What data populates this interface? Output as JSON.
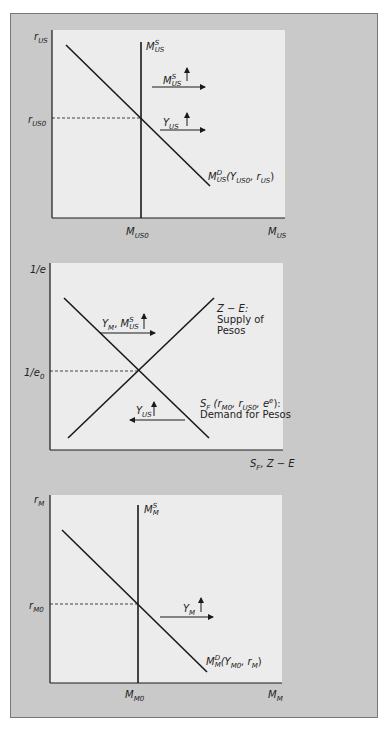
{
  "figure": {
    "panels": [
      {
        "id": "us-money-market",
        "y_axis_label": "r",
        "y_axis_sub": "US",
        "y_tick_label": "r",
        "y_tick_sub": "US0",
        "x_tick_label": "M",
        "x_tick_sub": "US0",
        "x_axis_label": "M",
        "x_axis_sub": "US",
        "supply_curve": {
          "main": "M",
          "sup": "S",
          "sub": "US"
        },
        "demand_curve": {
          "main": "M",
          "sup": "D",
          "sub": "US",
          "args": "(Y",
          "arg1_sub": "US0",
          "sep": ", r",
          "arg2_sub": "US",
          "close": ")"
        },
        "shifts": [
          {
            "main": "M",
            "sup": "S",
            "sub": "US",
            "arrow": "↑",
            "direction": "right"
          },
          {
            "main": "Y",
            "sub": "US",
            "arrow": "↑",
            "direction": "right"
          }
        ]
      },
      {
        "id": "foreign-exchange-market",
        "y_axis_label": "1/e",
        "y_tick_label": "1/e",
        "y_tick_sub": "0",
        "x_axis_label_a": "S",
        "x_axis_sub_a": "F",
        "x_axis_label_b": ", Z − E",
        "supply_curve": {
          "line1": "Z − E:",
          "line2": "Supply of",
          "line3": "Pesos"
        },
        "demand_curve": {
          "main": "S",
          "sub": "F",
          "open": " (r",
          "a1": "M0",
          "s1": ", r",
          "a2": "US0",
          "s2": ", e",
          "sup": "e",
          "close": "):",
          "line2": "Demand for Pesos"
        },
        "shifts": [
          {
            "main_a": "Y",
            "sub_a": "M",
            "sep": ", ",
            "main_b": "M",
            "sup_b": "S",
            "sub_b": "US",
            "arrow": "↑",
            "direction": "right"
          },
          {
            "main": "Y",
            "sub": "US",
            "arrow": "↑",
            "direction": "left"
          }
        ]
      },
      {
        "id": "mexico-money-market",
        "y_axis_label": "r",
        "y_axis_sub": "M",
        "y_tick_label": "r",
        "y_tick_sub": "M0",
        "x_tick_label": "M",
        "x_tick_sub": "M0",
        "x_axis_label": "M",
        "x_axis_sub": "M",
        "supply_curve": {
          "main": "M",
          "sup": "S",
          "sub": "M"
        },
        "demand_curve": {
          "main": "M",
          "sup": "D",
          "sub": "M",
          "args": "(Y",
          "arg1_sub": "M0",
          "sep": ", r",
          "arg2_sub": "M",
          "close": ")"
        },
        "shifts": [
          {
            "main": "Y",
            "sub": "M",
            "arrow": "↑",
            "direction": "right"
          }
        ]
      }
    ],
    "colors": {
      "frame": "#c9c9c9",
      "plot_bg": "#ececec",
      "line": "#1a1a1a"
    }
  }
}
